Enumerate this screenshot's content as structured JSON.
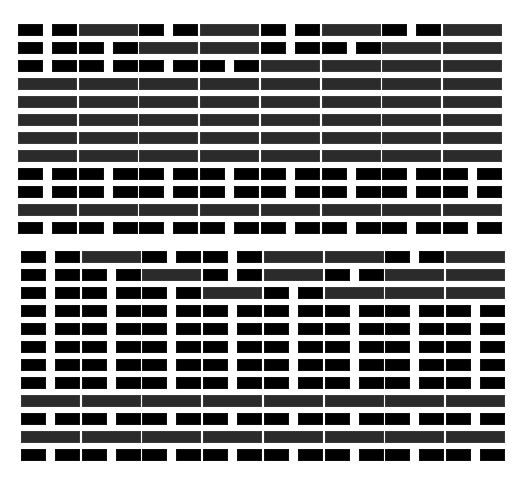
{
  "legend": {
    "B": "two black segments",
    "G": "one gray bar"
  },
  "colors": {
    "black": "#000000",
    "gray": "#2b2b2b",
    "background": "#ffffff"
  },
  "blocks": [
    {
      "name": "top-block",
      "rows": [
        "BGBGBGBG",
        "BBGGBBGG",
        "BBBBGGGG",
        "GGGGGGGG",
        "GGGGGGGG",
        "GGGGGGGG",
        "GGGGGGGG",
        "GGGGGGGG",
        "BBBBBBBB",
        "BBBBBBBB",
        "GGGGGGGG",
        "BBBBBBBB"
      ]
    },
    {
      "name": "bottom-block",
      "rows": [
        "BGBBGGBG",
        "BBGBGBGG",
        "BBBGBGGG",
        "BBBBBBBB",
        "BBBBBBBB",
        "BBBBBBBB",
        "BBBBBBBB",
        "BBBBBBBB",
        "GGGGGGGG",
        "BBBBBBBB",
        "GGGGGGGG",
        "BBBBBBBB"
      ]
    }
  ]
}
